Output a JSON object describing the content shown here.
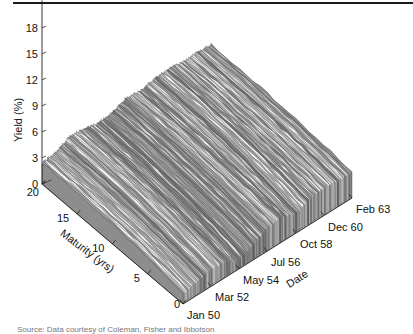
{
  "chart_data": {
    "type": "surface",
    "title": "",
    "xlabel": "Maturity (yrs)",
    "ylabel": "Date",
    "zlabel": "Yield (%)",
    "x_ticks": [
      "0",
      "5",
      "10",
      "15",
      "20"
    ],
    "x_tick_values": [
      0,
      5,
      10,
      15,
      20
    ],
    "x_range": [
      0,
      20
    ],
    "y_ticks": [
      "Jan 50",
      "Mar 52",
      "May 54",
      "Jul 56",
      "Oct 58",
      "Dec 60",
      "Feb 63"
    ],
    "y_tick_month_index": [
      0,
      26,
      52,
      78,
      105,
      131,
      157
    ],
    "z_ticks": [
      "0",
      "3",
      "6",
      "9",
      "12",
      "15",
      "18"
    ],
    "z_tick_values": [
      0,
      3,
      6,
      9,
      12,
      15,
      18
    ],
    "z_range": [
      0,
      18
    ],
    "grid": false,
    "surface_profile": {
      "description": "Approximate long-maturity (20 yr) and short-maturity (0 yr) yield by date, read from the ridge silhouette",
      "date_month_index": [
        0,
        13,
        26,
        39,
        52,
        65,
        78,
        91,
        105,
        118,
        131,
        144,
        157
      ],
      "yield_long_pct": [
        2.5,
        2.7,
        3.6,
        3.4,
        3.0,
        3.3,
        3.9,
        3.7,
        4.1,
        4.2,
        4.0,
        4.0,
        3.9
      ],
      "yield_short_pct": [
        1.2,
        1.5,
        2.0,
        1.8,
        1.0,
        1.8,
        2.6,
        3.0,
        2.2,
        3.0,
        3.2,
        3.0,
        3.0
      ]
    }
  },
  "source_note": "Source: Data courtesy of Coleman, Fisher and Ibbotson"
}
